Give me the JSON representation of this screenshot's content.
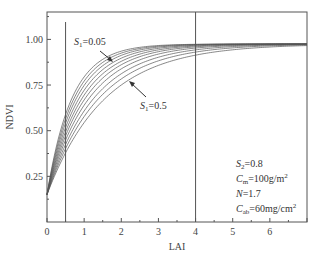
{
  "chart_data": {
    "type": "line",
    "title": "",
    "xlabel": "LAI",
    "ylabel": "NDVI",
    "xlim": [
      0,
      7
    ],
    "ylim": [
      0,
      1.15
    ],
    "xticks": [
      0,
      1,
      2,
      3,
      4,
      5,
      6
    ],
    "xtick_labels": [
      "0",
      "1",
      "2",
      "3",
      "4",
      "5",
      "6"
    ],
    "yticks": [
      0.25,
      0.5,
      0.75,
      1.0
    ],
    "ytick_labels": [
      "0.25",
      "0.50",
      "0.75",
      "1.00"
    ],
    "grid": false,
    "vertical_lines": [
      0.5,
      4
    ],
    "series": [
      {
        "name": "S1=0.05",
        "k": 1.52
      },
      {
        "name": "S1=0.10",
        "k": 1.4
      },
      {
        "name": "S1=0.15",
        "k": 1.29
      },
      {
        "name": "S1=0.20",
        "k": 1.18
      },
      {
        "name": "S1=0.25",
        "k": 1.08
      },
      {
        "name": "S1=0.30",
        "k": 0.99
      },
      {
        "name": "S1=0.35",
        "k": 0.9
      },
      {
        "name": "S1=0.40",
        "k": 0.81
      },
      {
        "name": "S1=0.45",
        "k": 0.73
      },
      {
        "name": "S1=0.50",
        "k": 0.65
      }
    ],
    "model": {
      "asymptote": 0.975,
      "intercept": 0.15
    },
    "annotations": {
      "top_curve": {
        "symbol": "S",
        "sub": "1",
        "text": "=0.05"
      },
      "bottom_curve": {
        "symbol": "S",
        "sub": "1",
        "text": "=0.5"
      },
      "params": [
        {
          "symbol": "S",
          "sub": "2",
          "text": "=0.8",
          "sup": ""
        },
        {
          "symbol": "C",
          "sub": "m",
          "text": "=100g/m",
          "sup": "2"
        },
        {
          "symbol": "N",
          "sub": "",
          "text": "=1.7",
          "sup": ""
        },
        {
          "symbol": "C",
          "sub": "ab",
          "text": "=60mg/cm",
          "sup": "2"
        }
      ]
    }
  },
  "colors": {
    "axis": "#555555",
    "curve": "#555555",
    "text": "#333333"
  }
}
